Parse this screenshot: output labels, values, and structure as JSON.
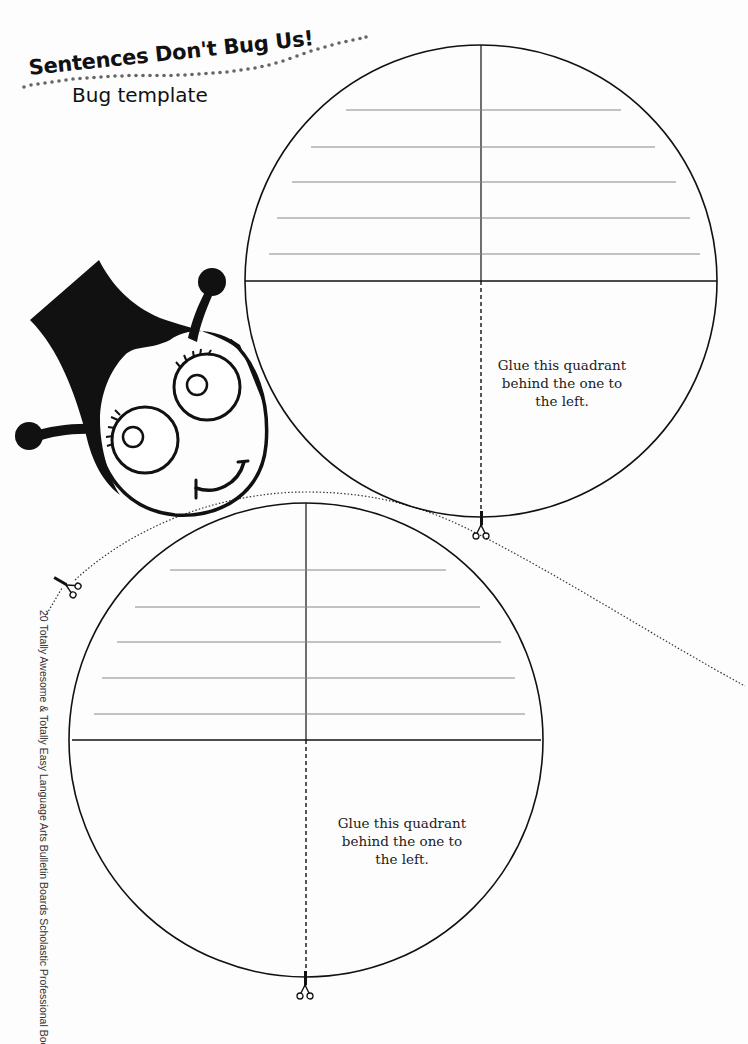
{
  "header": {
    "title": "Sentences Don't Bug Us!",
    "subtitle": "Bug template"
  },
  "top_circle": {
    "instruction_lines": [
      "Glue this quadrant",
      "behind the one to",
      "the left."
    ],
    "writing_lines": 5
  },
  "bottom_circle": {
    "instruction_lines": [
      "Glue this quadrant",
      "behind the one to",
      "the left."
    ],
    "writing_lines": 5
  },
  "footer": {
    "credit": "20 Totally Awesome & Totally Easy Language Arts Bulletin Boards  Scholastic Professional Books, page 37"
  },
  "icons": {
    "scissors": "scissors-icon",
    "bug": "bug-head-illustration"
  },
  "colors": {
    "ink": "#111111",
    "rule_line": "#888888",
    "paper": "#fdfdfd"
  }
}
